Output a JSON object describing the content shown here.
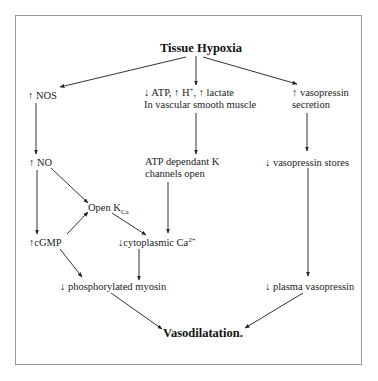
{
  "diagram": {
    "title": "Tissue Hypoxia",
    "outcome": "Vasodilatation.",
    "nodes": {
      "nos": "↑ NOS",
      "atp_line1": "↓ ATP, ↑ H",
      "atp_sup": "+",
      "atp_line1b": ", ↑ lactate",
      "atp_line2": "In vascular smooth muscle",
      "vaso_line1": "↑ vasopressin",
      "vaso_line2": "secretion",
      "no": "↑ NO",
      "katp_line1": "ATP dependant K",
      "katp_line2": "channels open",
      "vaso_stores": "↓ vasopressin stores",
      "open_k": "Open K",
      "open_k_sub": "Ca",
      "cgmp": "↑cGMP",
      "cyto_ca": "↓cytoplasmic Ca",
      "cyto_ca_sup": "2+",
      "myosin": "↓ phosphorylated myosin",
      "plasma_vaso": "↓ plasma vasopressin"
    },
    "edges": [
      {
        "from": "title",
        "to": "nos"
      },
      {
        "from": "title",
        "to": "atp"
      },
      {
        "from": "title",
        "to": "vaso_secretion"
      },
      {
        "from": "nos",
        "to": "no"
      },
      {
        "from": "atp",
        "to": "katp"
      },
      {
        "from": "vaso_secretion",
        "to": "vaso_stores"
      },
      {
        "from": "no",
        "to": "cgmp"
      },
      {
        "from": "no",
        "to": "open_k"
      },
      {
        "from": "cgmp",
        "to": "open_k"
      },
      {
        "from": "open_k",
        "to": "cyto_ca"
      },
      {
        "from": "katp",
        "to": "cyto_ca"
      },
      {
        "from": "vaso_stores",
        "to": "plasma_vaso"
      },
      {
        "from": "cgmp",
        "to": "myosin"
      },
      {
        "from": "cyto_ca",
        "to": "myosin"
      },
      {
        "from": "myosin",
        "to": "outcome"
      },
      {
        "from": "plasma_vaso",
        "to": "outcome"
      }
    ]
  }
}
